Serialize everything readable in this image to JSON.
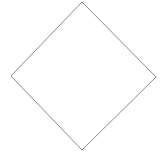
{
  "canvas": {
    "width": 166,
    "height": 155,
    "background_color": "#ffffff",
    "title": "Diamond outline"
  },
  "shape": {
    "name": "diamond",
    "type": "rhombus-outline",
    "label": "Diamond",
    "fill": "none",
    "fill_color": "#ffffff",
    "stroke_color": "#8a8a8a",
    "stroke_width": 1,
    "vertices": [
      {
        "name": "top",
        "x": 82,
        "y": 2
      },
      {
        "name": "right",
        "x": 156,
        "y": 77
      },
      {
        "name": "bottom",
        "x": 82,
        "y": 150
      },
      {
        "name": "left",
        "x": 11,
        "y": 76
      }
    ],
    "points_attr": "82,2 156,77 82,150 11,76",
    "width": 145,
    "height": 148
  }
}
